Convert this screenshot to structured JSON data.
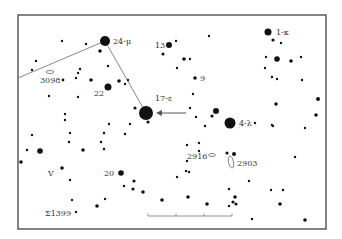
{
  "chart": {
    "frame": {
      "x": 18,
      "y": 15,
      "w": 308,
      "h": 214,
      "color": "#333333"
    },
    "colors": {
      "star": "#111111",
      "line": "#888888",
      "label": "#333333",
      "background": "#ffffff"
    }
  },
  "labels": {
    "mu": "24-μ",
    "kappa": "1-κ",
    "thirteen": "13",
    "nine": "9",
    "twentytwo": "22",
    "n3098": "3098",
    "epsilon": "17-ε",
    "lambda": "4-λ",
    "n2916": "2916",
    "n2903": "2903",
    "v": "V",
    "twenty": "20",
    "sigma": "Σ1399"
  },
  "scale_bar": {
    "x1": 148,
    "x2": 232,
    "y": 216,
    "ticks": [
      148,
      176,
      204,
      232
    ]
  },
  "constellation_lines": [
    {
      "x1": 18,
      "y1": 78,
      "x2": 105,
      "y2": 41
    },
    {
      "x1": 105,
      "y1": 41,
      "x2": 146,
      "y2": 113
    }
  ],
  "pointer_arrow": {
    "from_x": 186,
    "from_y": 113,
    "to_x": 156,
    "to_y": 113
  },
  "galaxies": [
    {
      "name": "3098",
      "cx": 50,
      "cy": 72,
      "rx": 4,
      "ry": 1.5,
      "rotate": 0
    },
    {
      "name": "2916",
      "cx": 212,
      "cy": 155,
      "rx": 3.5,
      "ry": 1.5,
      "rotate": 0
    },
    {
      "name": "2903",
      "cx": 231,
      "cy": 162,
      "rx": 2.5,
      "ry": 6,
      "rotate": -12
    }
  ],
  "stars": [
    {
      "x": 105,
      "y": 41,
      "r": 5
    },
    {
      "x": 62,
      "y": 41,
      "r": 1.2
    },
    {
      "x": 86,
      "y": 44,
      "r": 1.2
    },
    {
      "x": 100,
      "y": 51,
      "r": 1.8
    },
    {
      "x": 36,
      "y": 61,
      "r": 1.2
    },
    {
      "x": 32,
      "y": 70,
      "r": 1.2
    },
    {
      "x": 80,
      "y": 69,
      "r": 1.2
    },
    {
      "x": 108,
      "y": 66,
      "r": 1.2
    },
    {
      "x": 78,
      "y": 73,
      "r": 1.2
    },
    {
      "x": 76,
      "y": 78,
      "r": 1.2
    },
    {
      "x": 63,
      "y": 80,
      "r": 1.4
    },
    {
      "x": 91,
      "y": 80,
      "r": 1.8
    },
    {
      "x": 108,
      "y": 87,
      "r": 3.5
    },
    {
      "x": 119,
      "y": 81,
      "r": 1.8
    },
    {
      "x": 125,
      "y": 84,
      "r": 1.2
    },
    {
      "x": 128,
      "y": 80,
      "r": 1.2
    },
    {
      "x": 49,
      "y": 96,
      "r": 1.2
    },
    {
      "x": 78,
      "y": 97,
      "r": 1.2
    },
    {
      "x": 146,
      "y": 113,
      "r": 7
    },
    {
      "x": 135,
      "y": 108,
      "r": 1.6
    },
    {
      "x": 148,
      "y": 122,
      "r": 1.6
    },
    {
      "x": 169,
      "y": 45,
      "r": 3
    },
    {
      "x": 176,
      "y": 41,
      "r": 1.2
    },
    {
      "x": 163,
      "y": 54,
      "r": 1.6
    },
    {
      "x": 184,
      "y": 59,
      "r": 1.8
    },
    {
      "x": 190,
      "y": 59,
      "r": 1.2
    },
    {
      "x": 177,
      "y": 68,
      "r": 1.2
    },
    {
      "x": 195,
      "y": 78,
      "r": 1.8
    },
    {
      "x": 209,
      "y": 36,
      "r": 1.2
    },
    {
      "x": 193,
      "y": 94,
      "r": 1.2
    },
    {
      "x": 190,
      "y": 108,
      "r": 1.2
    },
    {
      "x": 216,
      "y": 111,
      "r": 3
    },
    {
      "x": 212,
      "y": 116,
      "r": 1.6
    },
    {
      "x": 196,
      "y": 117,
      "r": 1.2
    },
    {
      "x": 205,
      "y": 126,
      "r": 1.2
    },
    {
      "x": 230,
      "y": 123,
      "r": 5.5
    },
    {
      "x": 255,
      "y": 123,
      "r": 1.2
    },
    {
      "x": 272,
      "y": 125,
      "r": 1.2
    },
    {
      "x": 268,
      "y": 32,
      "r": 3.5
    },
    {
      "x": 273,
      "y": 40,
      "r": 1.6
    },
    {
      "x": 281,
      "y": 43,
      "r": 1.2
    },
    {
      "x": 266,
      "y": 57,
      "r": 1.2
    },
    {
      "x": 277,
      "y": 59,
      "r": 2.8
    },
    {
      "x": 291,
      "y": 61,
      "r": 1.8
    },
    {
      "x": 301,
      "y": 57,
      "r": 1.2
    },
    {
      "x": 265,
      "y": 68,
      "r": 1.2
    },
    {
      "x": 272,
      "y": 77,
      "r": 1.2
    },
    {
      "x": 277,
      "y": 79,
      "r": 1.2
    },
    {
      "x": 302,
      "y": 80,
      "r": 1.2
    },
    {
      "x": 318,
      "y": 99,
      "r": 2
    },
    {
      "x": 276,
      "y": 104,
      "r": 1.8
    },
    {
      "x": 316,
      "y": 115,
      "r": 1.8
    },
    {
      "x": 273,
      "y": 126,
      "r": 1.2
    },
    {
      "x": 305,
      "y": 128,
      "r": 1.2
    },
    {
      "x": 295,
      "y": 157,
      "r": 1.2
    },
    {
      "x": 271,
      "y": 190,
      "r": 1.2
    },
    {
      "x": 283,
      "y": 190,
      "r": 1.2
    },
    {
      "x": 280,
      "y": 204,
      "r": 1.8
    },
    {
      "x": 305,
      "y": 220,
      "r": 1.8
    },
    {
      "x": 234,
      "y": 154,
      "r": 2
    },
    {
      "x": 227,
      "y": 153,
      "r": 1.6
    },
    {
      "x": 187,
      "y": 145,
      "r": 1.2
    },
    {
      "x": 199,
      "y": 143,
      "r": 1.2
    },
    {
      "x": 199,
      "y": 151,
      "r": 1.2
    },
    {
      "x": 187,
      "y": 161,
      "r": 1.2
    },
    {
      "x": 186,
      "y": 171,
      "r": 1.2
    },
    {
      "x": 189,
      "y": 172,
      "r": 1.2
    },
    {
      "x": 177,
      "y": 177,
      "r": 1.2
    },
    {
      "x": 249,
      "y": 181,
      "r": 1.2
    },
    {
      "x": 229,
      "y": 189,
      "r": 1.2
    },
    {
      "x": 188,
      "y": 197,
      "r": 1.8
    },
    {
      "x": 207,
      "y": 204,
      "r": 1.8
    },
    {
      "x": 235,
      "y": 197,
      "r": 1.8
    },
    {
      "x": 233,
      "y": 202,
      "r": 1.6
    },
    {
      "x": 229,
      "y": 206,
      "r": 1.2
    },
    {
      "x": 236,
      "y": 204,
      "r": 1.6
    },
    {
      "x": 252,
      "y": 219,
      "r": 1.2
    },
    {
      "x": 83,
      "y": 150,
      "r": 1.8
    },
    {
      "x": 121,
      "y": 173,
      "r": 2.8
    },
    {
      "x": 134,
      "y": 181,
      "r": 1.6
    },
    {
      "x": 124,
      "y": 186,
      "r": 1.2
    },
    {
      "x": 133,
      "y": 189,
      "r": 1.6
    },
    {
      "x": 143,
      "y": 192,
      "r": 1.8
    },
    {
      "x": 162,
      "y": 200,
      "r": 1.8
    },
    {
      "x": 104,
      "y": 149,
      "r": 1.2
    },
    {
      "x": 109,
      "y": 124,
      "r": 1.2
    },
    {
      "x": 104,
      "y": 133,
      "r": 1.2
    },
    {
      "x": 125,
      "y": 134,
      "r": 1.2
    },
    {
      "x": 101,
      "y": 142,
      "r": 1.2
    },
    {
      "x": 65,
      "y": 120,
      "r": 1.2
    },
    {
      "x": 70,
      "y": 133,
      "r": 1.2
    },
    {
      "x": 69,
      "y": 142,
      "r": 1.2
    },
    {
      "x": 32,
      "y": 135,
      "r": 1.2
    },
    {
      "x": 27,
      "y": 150,
      "r": 1.2
    },
    {
      "x": 40,
      "y": 151,
      "r": 2.8
    },
    {
      "x": 21,
      "y": 162,
      "r": 1.8
    },
    {
      "x": 62,
      "y": 168,
      "r": 1.8
    },
    {
      "x": 70,
      "y": 180,
      "r": 1.2
    },
    {
      "x": 72,
      "y": 200,
      "r": 1.2
    },
    {
      "x": 76,
      "y": 212,
      "r": 1.2
    },
    {
      "x": 97,
      "y": 206,
      "r": 1.8
    },
    {
      "x": 105,
      "y": 199,
      "r": 1.2
    },
    {
      "x": 155,
      "y": 114,
      "r": 0
    },
    {
      "x": 65,
      "y": 114,
      "r": 1.2
    },
    {
      "x": 130,
      "y": 124,
      "r": 1.2
    }
  ]
}
